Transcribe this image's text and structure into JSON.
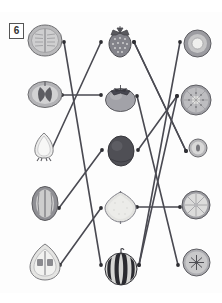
{
  "exercise": {
    "number": "6",
    "type": "matching-worksheet",
    "instruction_visible": false
  },
  "colors": {
    "line": "#4a4a52",
    "dot": "#2e2e33",
    "box_border": "#555555",
    "page_background": "#fdfdfd",
    "strawberry": "#8e8e94",
    "persimmon": "#9a9aa0",
    "kiwi": "#4d4d53",
    "lemon": "#dcdcd8",
    "watermelon": "#3a3a40"
  },
  "columns": {
    "left": {
      "name": "cross-sections-left",
      "items": [
        {
          "id": "L1",
          "label": "melon-cross-section",
          "x": 27,
          "y": 24,
          "w": 36,
          "h": 33
        },
        {
          "id": "L2",
          "label": "apple-cross-section",
          "x": 27,
          "y": 80,
          "w": 36,
          "h": 29
        },
        {
          "id": "L3",
          "label": "strawberry-cross-section",
          "x": 31,
          "y": 130,
          "w": 26,
          "h": 32
        },
        {
          "id": "L4",
          "label": "watermelon-whole-small",
          "x": 30,
          "y": 185,
          "w": 30,
          "h": 37
        },
        {
          "id": "L5",
          "label": "avocado-cross-section",
          "x": 27,
          "y": 242,
          "w": 36,
          "h": 40
        }
      ]
    },
    "middle": {
      "name": "whole-fruits-middle",
      "items": [
        {
          "id": "M1",
          "label": "strawberry-whole",
          "x": 105,
          "y": 24,
          "w": 30,
          "h": 34
        },
        {
          "id": "M2",
          "label": "persimmon-whole",
          "x": 103,
          "y": 82,
          "w": 35,
          "h": 30
        },
        {
          "id": "M3",
          "label": "kiwi-whole",
          "x": 106,
          "y": 135,
          "w": 30,
          "h": 32
        },
        {
          "id": "M4",
          "label": "lemon-whole",
          "x": 103,
          "y": 190,
          "w": 35,
          "h": 35
        },
        {
          "id": "M5",
          "label": "watermelon-whole",
          "x": 103,
          "y": 248,
          "w": 36,
          "h": 38
        }
      ]
    },
    "right": {
      "name": "cross-sections-right",
      "items": [
        {
          "id": "R1",
          "label": "avocado-ring-cross-section",
          "x": 183,
          "y": 29,
          "w": 29,
          "h": 29
        },
        {
          "id": "R2",
          "label": "kiwi-cross-section",
          "x": 180,
          "y": 84,
          "w": 32,
          "h": 32
        },
        {
          "id": "R3",
          "label": "persimmon-cross-section-small",
          "x": 188,
          "y": 138,
          "w": 20,
          "h": 20
        },
        {
          "id": "R4",
          "label": "lemon-cross-section",
          "x": 181,
          "y": 190,
          "w": 30,
          "h": 30
        },
        {
          "id": "R5",
          "label": "apple-cross-section-star",
          "x": 182,
          "y": 248,
          "w": 29,
          "h": 29
        }
      ]
    }
  },
  "connections": [
    {
      "id": "c1",
      "from": "L1-right",
      "to": "M5-left",
      "x1": 64,
      "y1": 42,
      "x2": 101,
      "y2": 265
    },
    {
      "id": "c2",
      "from": "L3-right",
      "to": "M1-left",
      "x1": 50,
      "y1": 153,
      "x2": 101,
      "y2": 42
    },
    {
      "id": "c3",
      "from": "L2-right",
      "to": "M2-left",
      "x1": 62,
      "y1": 95,
      "x2": 101,
      "y2": 95
    },
    {
      "id": "c4",
      "from": "L4-right",
      "to": "M3-left",
      "x1": 59,
      "y1": 208,
      "x2": 102,
      "y2": 150
    },
    {
      "id": "c5",
      "from": "L5-right",
      "to": "M4-left",
      "x1": 60,
      "y1": 265,
      "x2": 101,
      "y2": 208
    },
    {
      "id": "c6",
      "from": "M1-right",
      "to": "R3-left",
      "x1": 134,
      "y1": 42,
      "x2": 186,
      "y2": 151
    },
    {
      "id": "c7",
      "from": "M2-right",
      "to": "R4-left",
      "x1": 137,
      "y1": 96,
      "x2": 180,
      "y2": 207
    },
    {
      "id": "c8",
      "from": "M3-right",
      "to": "R2-left",
      "x1": 138,
      "y1": 150,
      "x2": 177,
      "y2": 96
    },
    {
      "id": "c9",
      "from": "M4-right",
      "to": "R4-left2",
      "x1": 137,
      "y1": 207,
      "x2": 180,
      "y2": 207
    },
    {
      "id": "c10",
      "from": "M5-right",
      "to": "R2-left2",
      "x1": 139,
      "y1": 265,
      "x2": 177,
      "y2": 96
    },
    {
      "id": "c11",
      "from": "R1-left",
      "to": "M5-right2",
      "x1": 180,
      "y1": 42,
      "x2": 139,
      "y2": 265
    },
    {
      "id": "c12",
      "from": "R5-left",
      "to": "M4-right2",
      "x1": 178,
      "y1": 265,
      "x2": 137,
      "y2": 207
    }
  ],
  "line_paths": [
    {
      "name": "melon-to-watermelon",
      "pts": [
        [
          64,
          42
        ],
        [
          101,
          265
        ]
      ]
    },
    {
      "name": "strawberryslice-to-strawberry",
      "pts": [
        [
          50,
          153
        ],
        [
          101,
          42
        ]
      ]
    },
    {
      "name": "apple-to-persimmon",
      "pts": [
        [
          62,
          95
        ],
        [
          101,
          95
        ]
      ]
    },
    {
      "name": "watermelonsmall-to-kiwi",
      "pts": [
        [
          59,
          208
        ],
        [
          102,
          150
        ]
      ]
    },
    {
      "name": "avocado-to-lemon",
      "pts": [
        [
          60,
          265
        ],
        [
          101,
          208
        ]
      ]
    },
    {
      "name": "strawberry-to-smallslice",
      "pts": [
        [
          134,
          42
        ],
        [
          186,
          151
        ]
      ]
    },
    {
      "name": "persimmon-to-apple-star",
      "pts": [
        [
          137,
          96
        ],
        [
          178,
          265
        ]
      ]
    },
    {
      "name": "kiwi-to-kiwislice",
      "pts": [
        [
          138,
          150
        ],
        [
          177,
          96
        ]
      ]
    },
    {
      "name": "lemon-to-lemonslice",
      "pts": [
        [
          137,
          207
        ],
        [
          180,
          207
        ]
      ]
    },
    {
      "name": "watermelon-to-avocadoring",
      "pts": [
        [
          139,
          265
        ],
        [
          180,
          42
        ]
      ]
    },
    {
      "name": "persimmonslice-cross",
      "pts": [
        [
          186,
          151
        ],
        [
          134,
          42
        ]
      ]
    },
    {
      "name": "kiwislice-cross",
      "pts": [
        [
          177,
          96
        ],
        [
          139,
          265
        ]
      ]
    }
  ]
}
